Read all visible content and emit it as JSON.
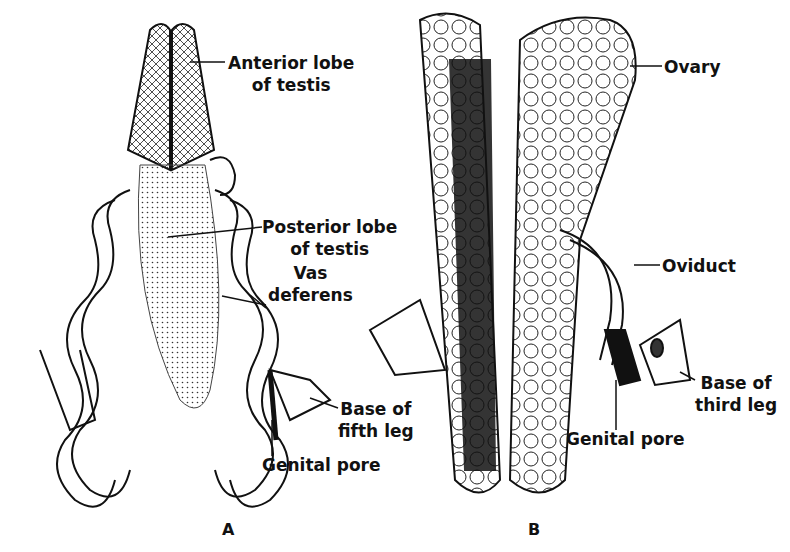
{
  "figure_a": {
    "letter": "A",
    "labels": {
      "anterior_l1": "Anterior lobe",
      "anterior_l2": "of testis",
      "posterior_l1": "Posterior lobe",
      "posterior_l2": "of testis",
      "vas_l1": "Vas",
      "vas_l2": "deferens",
      "base5_l1": "Base of",
      "base5_l2": "fifth leg",
      "pore": "Genital pore"
    }
  },
  "figure_b": {
    "letter": "B",
    "labels": {
      "ovary": "Ovary",
      "oviduct": "Oviduct",
      "base3_l1": "Base of",
      "base3_l2": "third leg",
      "pore": "Genital pore"
    }
  }
}
